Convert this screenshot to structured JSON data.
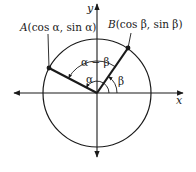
{
  "diagram": {
    "type": "unit-circle-angle-difference",
    "colors": {
      "ink": "#1a1a1a",
      "background": "#ffffff"
    },
    "axes": {
      "x_label": "x",
      "y_label": "y"
    },
    "points": {
      "A": {
        "name": "A",
        "coords_text": "(cos α, sin α)"
      },
      "B": {
        "name": "B",
        "coords_text": "(cos β, sin β)"
      }
    },
    "angles": {
      "alpha": "α",
      "beta": "β",
      "difference": "α − β"
    }
  }
}
